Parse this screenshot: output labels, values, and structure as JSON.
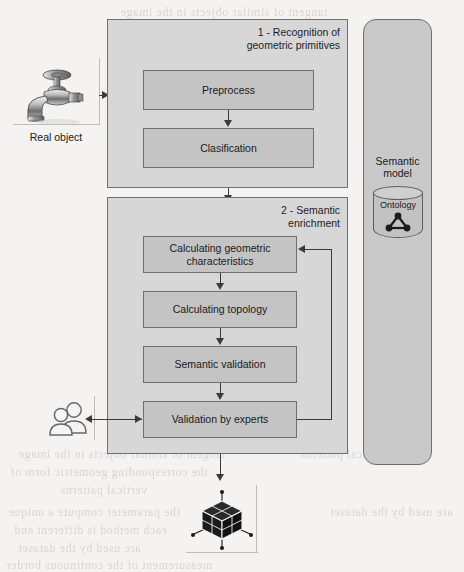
{
  "figure": {
    "background_color": "#f4f3f1",
    "container_fill": "#d7d7d7",
    "box_fill": "#c4c4c4",
    "panel_fill": "#c9c9c9",
    "stroke_color": "#6f6f6f",
    "arrow_color": "#3a3a3a"
  },
  "inputs": {
    "real_object": {
      "label": "Real object",
      "icon": "faucet-tap-icon"
    },
    "experts": {
      "label": "",
      "icon": "two-people-experts-icon"
    }
  },
  "output": {
    "label": "",
    "icon": "3d-cube-mesh-model-icon"
  },
  "stages": [
    {
      "id": "stage-1",
      "label": "1 - Recognition of\ngeometric primitives",
      "steps": [
        {
          "id": "preprocess",
          "label": "Preprocess"
        },
        {
          "id": "clasification",
          "label": "Clasification"
        }
      ]
    },
    {
      "id": "stage-2",
      "label": "2 - Semantic\nenrichment",
      "steps": [
        {
          "id": "calculating-geometric-characteristics",
          "label": "Calculating geometric\ncharacteristics"
        },
        {
          "id": "calculating-topology",
          "label": "Calculating topology"
        },
        {
          "id": "semantic-validation",
          "label": "Semantic validation"
        },
        {
          "id": "validation-by-experts",
          "label": "Validation by experts"
        }
      ]
    }
  ],
  "semantic_model": {
    "label": "Semantic model",
    "store": {
      "label": "Ontology",
      "icon": "ontology-graph-icon",
      "shape": "cylinder-database"
    }
  },
  "connectors": [
    {
      "id": "real-object-to-stage-1",
      "from": "real_object",
      "to": "stage-1",
      "direction": "right"
    },
    {
      "id": "preprocess-to-clasification",
      "from": "preprocess",
      "to": "clasification",
      "direction": "down"
    },
    {
      "id": "stage-1-to-stage-2",
      "from": "stage-1",
      "to": "stage-2",
      "direction": "down"
    },
    {
      "id": "geom-to-topology",
      "from": "calculating-geometric-characteristics",
      "to": "calculating-topology",
      "direction": "down"
    },
    {
      "id": "topology-to-semantic-validation",
      "from": "calculating-topology",
      "to": "semantic-validation",
      "direction": "down"
    },
    {
      "id": "semantic-validation-to-experts",
      "from": "semantic-validation",
      "to": "validation-by-experts",
      "direction": "down"
    },
    {
      "id": "experts-feedback-loop",
      "from": "validation-by-experts",
      "to": "calculating-geometric-characteristics",
      "direction": "up-left"
    },
    {
      "id": "experts-icon-bidirectional",
      "from": "experts",
      "to": "validation-by-experts",
      "direction": "bidirectional"
    },
    {
      "id": "stage-2-to-output",
      "from": "stage-2",
      "to": "output",
      "direction": "down"
    }
  ],
  "scan_noise": {
    "note": "faint mirrored text bleed-through from reverse side of scanned page",
    "lines": [
      "tangent of similar objects in the image",
      "the corresponding geometric form of",
      "vertical patterns",
      "the parameter compute a unique",
      "each method is different and",
      "are used by the dataset",
      "measurement of the continuous border"
    ]
  }
}
